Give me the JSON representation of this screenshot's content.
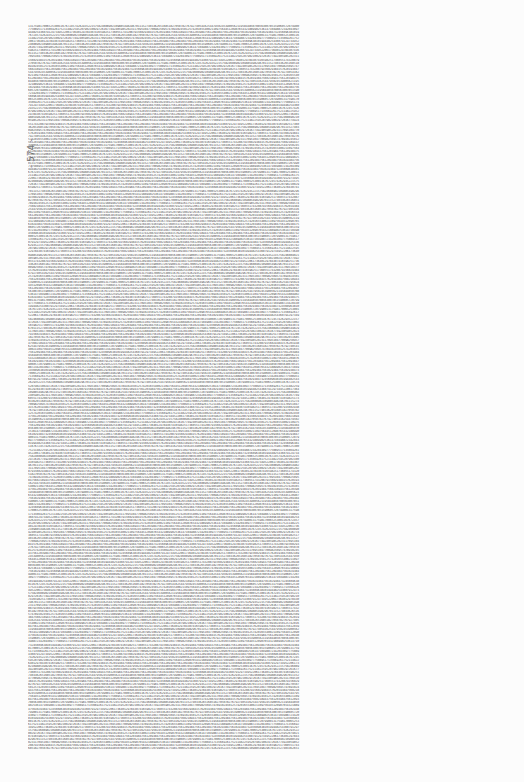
{
  "page": {
    "page_number_label": "- 574 -",
    "content_type": "dense table of decimal digits",
    "background_color": "#fcfcfc",
    "text_color": "#555555",
    "visible_sample_lines": [
      "13175981700652530011676724574262935221575824608902109885498296701115274033626516851827050782767927405416254479502453900562119584485070856300785159060572079900",
      "20430977750895171356692617521148225952079021002972616774924059852023117095104770098250957478910245012574201655400211097564451209076543218899025361471049887234",
      "32456096381019944825436079129734952206173640129784307416598251736055174320879156029384157620193847560218943756120398475612093847561209384756102938475610293847"
    ],
    "line_count_estimate": 238,
    "digits_per_line_estimate": 160
  }
}
